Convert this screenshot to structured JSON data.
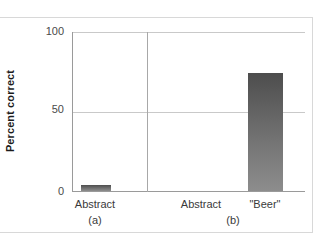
{
  "chart_data": {
    "type": "bar",
    "title": "",
    "xlabel": "",
    "ylabel": "Percent correct",
    "ylim": [
      0,
      100
    ],
    "yticks": [
      "0",
      "50",
      "100"
    ],
    "grid": true,
    "legend": "none",
    "panels": [
      {
        "tag": "(a)",
        "categories": [
          "Abstract"
        ],
        "values": [
          4
        ]
      },
      {
        "tag": "(b)",
        "categories": [
          "Abstract",
          "\"Beer\""
        ],
        "values": [
          0,
          74
        ]
      }
    ],
    "bar_color_top": "#4d4d4d",
    "bar_color_bottom": "#8d8d8d",
    "gridline_color": "#c9c9c9",
    "axis_color": "#9a9a9a"
  },
  "axis": {
    "y_label": "Percent correct",
    "tick_100": "100",
    "tick_50": "50",
    "tick_0": "0"
  },
  "panel_a": {
    "tag": "(a)",
    "label_abstract": "Abstract"
  },
  "panel_b": {
    "tag": "(b)",
    "label_abstract": "Abstract",
    "label_beer": "\"Beer\""
  }
}
